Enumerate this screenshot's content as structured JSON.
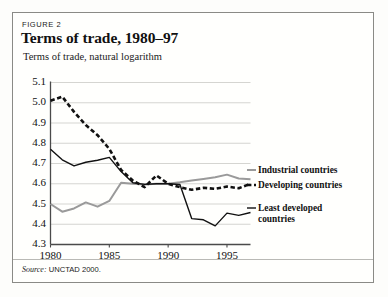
{
  "figure": {
    "label": "FIGURE 2",
    "title": "Terms of trade, 1980–97",
    "axis_caption": "Terms of trade, natural logarithm",
    "source_prefix": "Source:",
    "source_text": "UNCTAD 2000."
  },
  "legend": {
    "industrial": "Industrial countries",
    "developing": "Developing countries",
    "least_developed_line1": "Least developed",
    "least_developed_line2": "countries"
  },
  "colors": {
    "industrial": "#9a9a9a",
    "developing": "#111111",
    "least_developed": "#111111",
    "grid": "#d0d0cc",
    "axis": "#4a4a4a",
    "frame": "#8a8a86",
    "background": "#fffffd"
  },
  "chart_data": {
    "type": "line",
    "title": "Terms of trade, 1980–97",
    "subtitle": "FIGURE 2",
    "xlabel": "",
    "ylabel": "Terms of trade, natural logarithm",
    "xlim": [
      1980,
      1997
    ],
    "ylim": [
      4.3,
      5.1
    ],
    "ytick_step": 0.1,
    "yticks": [
      "5.1",
      "5.0",
      "4.9",
      "4.8",
      "4.7",
      "4.6",
      "4.5",
      "4.4",
      "4.3"
    ],
    "ytick_values": [
      5.1,
      5.0,
      4.9,
      4.8,
      4.7,
      4.6,
      4.5,
      4.4,
      4.3
    ],
    "xticks": [
      "1980",
      "1985",
      "1990",
      "1995"
    ],
    "xtick_values": [
      1980,
      1985,
      1990,
      1995
    ],
    "grid": "horizontal",
    "legend_position": "right-inline",
    "source": "Source: UNCTAD 2000.",
    "x": [
      1980,
      1981,
      1982,
      1983,
      1984,
      1985,
      1986,
      1987,
      1988,
      1989,
      1990,
      1991,
      1992,
      1993,
      1994,
      1995,
      1996,
      1997
    ],
    "series": [
      {
        "name": "Industrial countries",
        "style": "solid",
        "color": "#9a9a9a",
        "width": 2.0,
        "values": [
          4.5,
          4.462,
          4.478,
          4.508,
          4.487,
          4.515,
          4.605,
          4.6,
          4.596,
          4.6,
          4.6,
          4.607,
          4.616,
          4.624,
          4.632,
          4.645,
          4.626,
          4.622
        ]
      },
      {
        "name": "Developing countries",
        "style": "dashed",
        "color": "#111111",
        "width": 2.6,
        "values": [
          5.01,
          5.03,
          4.955,
          4.89,
          4.84,
          4.772,
          4.668,
          4.616,
          4.583,
          4.641,
          4.6,
          4.583,
          4.57,
          4.58,
          4.575,
          4.586,
          4.578,
          4.6
        ]
      },
      {
        "name": "Least developed countries",
        "style": "solid",
        "color": "#111111",
        "width": 1.4,
        "values": [
          4.77,
          4.718,
          4.688,
          4.706,
          4.716,
          4.73,
          4.66,
          4.605,
          4.597,
          4.6,
          4.6,
          4.596,
          4.428,
          4.422,
          4.392,
          4.455,
          4.444,
          4.458
        ]
      }
    ]
  }
}
